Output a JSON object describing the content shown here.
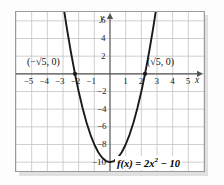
{
  "chart_data": {
    "type": "line",
    "title": "",
    "subtitle": "",
    "xlabel": "x",
    "ylabel": "y",
    "function_label": "f(x) = 2x² − 10",
    "function_parts": {
      "lhs": "f(x) = 2x",
      "exponent": "2",
      "rhs": " − 10"
    },
    "equation_latex": "f(x) = 2x^2 - 10",
    "coefficients": {
      "a": 2,
      "b": 0,
      "c": -10
    },
    "vertex": {
      "x": 0,
      "y": -10
    },
    "roots": [
      -2.2360679,
      2.2360679
    ],
    "grid": true,
    "legend": "none",
    "xlim": [
      -6,
      6
    ],
    "ylim": [
      -11,
      7
    ],
    "xticks": [
      -5,
      -4,
      -3,
      -2,
      -1,
      1,
      2,
      3,
      4,
      5
    ],
    "yticks": [
      6,
      4,
      2,
      -2,
      -4,
      -6,
      -8,
      -10
    ],
    "xtick_labels": [
      "−5",
      "−4",
      "−3",
      "−2",
      "−1",
      "1",
      "2",
      "3",
      "4",
      "5"
    ],
    "ytick_labels": [
      "6",
      "4",
      "2",
      "−2",
      "−4",
      "−6",
      "−8",
      "−10"
    ],
    "annotations": [
      {
        "text": "(−√5, 0)",
        "x": -2.2360679,
        "y": 0,
        "position": "above-left"
      },
      {
        "text": "(√5, 0)",
        "x": 2.2360679,
        "y": 0,
        "position": "above-right"
      }
    ],
    "marked_points": [
      {
        "x": -2.2360679,
        "y": 0
      },
      {
        "x": 2.2360679,
        "y": 0
      }
    ],
    "series": [
      {
        "name": "f(x) = 2x² − 10",
        "x": [
          -2.95,
          -2.75,
          -2.5,
          -2.2360679,
          -2.0,
          -1.75,
          -1.5,
          -1.25,
          -1.0,
          -0.75,
          -0.5,
          -0.25,
          0,
          0.25,
          0.5,
          0.75,
          1.0,
          1.25,
          1.5,
          1.75,
          2.0,
          2.2360679,
          2.5,
          2.75,
          2.95
        ],
        "y": [
          7.405,
          5.125,
          2.5,
          0,
          -2.0,
          -3.875,
          -5.5,
          -6.875,
          -8.0,
          -8.875,
          -9.5,
          -9.875,
          -10,
          -9.875,
          -9.5,
          -8.875,
          -8.0,
          -6.875,
          -5.5,
          -3.875,
          -2.0,
          0,
          2.5,
          5.125,
          7.405
        ]
      }
    ],
    "colors": {
      "curve": "#1a1a1a",
      "grid": "#c4c4c4",
      "axis": "#555555",
      "frame": "#9a9a9a",
      "background": "#ffffff"
    }
  },
  "annotation_labels": {
    "left_root": "(−√5, 0)",
    "right_root": "(√5, 0)"
  },
  "axis_names": {
    "x": "x",
    "y": "y"
  }
}
